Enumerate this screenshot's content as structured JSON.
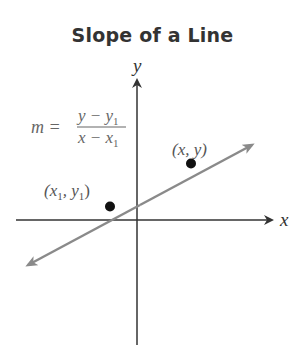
{
  "title": "Slope of a Line",
  "formula": {
    "lhs": "m =",
    "numerator": "y − y",
    "numerator_sub": "1",
    "denominator": "x − x",
    "denominator_sub": "1"
  },
  "axes": {
    "x_label": "x",
    "y_label": "y"
  },
  "points": [
    {
      "label_open": "(x",
      "label_sub": "1",
      "label_mid": ", y",
      "label_sub2": "1",
      "label_close": ")"
    },
    {
      "label": "(x, y)"
    }
  ],
  "colors": {
    "axis": "#333333",
    "line": "#8a8a8a",
    "point": "#111111",
    "formula_text": "#666666",
    "title": "#333333"
  }
}
